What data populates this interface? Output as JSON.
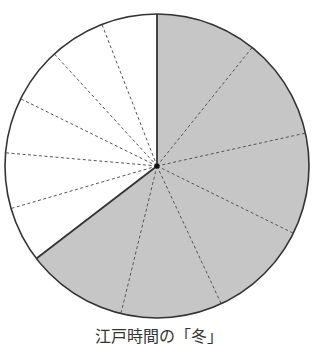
{
  "caption": "江戸時間の「冬」",
  "colors": {
    "night_fill": "#c6c6c6",
    "day_fill": "#ffffff",
    "outline": "#333333",
    "divider": "#555555"
  },
  "geometry": {
    "cx": 157,
    "cy": 166,
    "r": 152
  },
  "chart_data": {
    "type": "pie",
    "title": "江戸時間の「冬」",
    "start_angle_deg": 0,
    "direction": "clockwise",
    "series": [
      {
        "name": "night (gray)",
        "fill": "#c6c6c6",
        "span_deg": 232.5,
        "divisions": 6,
        "segment_deg": [
          38.75,
          38.75,
          38.75,
          38.75,
          38.75,
          38.75
        ]
      },
      {
        "name": "day (white)",
        "fill": "#ffffff",
        "span_deg": 127.5,
        "divisions": 6,
        "segment_deg": [
          21.25,
          21.25,
          21.25,
          21.25,
          21.25,
          21.25
        ]
      }
    ],
    "boundary_angles_deg": [
      0,
      38.75,
      77.5,
      116.25,
      155,
      193.75,
      232.5,
      253.75,
      275,
      296.25,
      317.5,
      338.75
    ],
    "solid_boundaries_deg": [
      0,
      232.5
    ],
    "dashed_boundaries_deg": [
      38.75,
      77.5,
      116.25,
      155,
      193.75,
      253.75,
      275,
      296.25,
      317.5,
      338.75
    ],
    "legend": [],
    "xlabel": "",
    "ylabel": ""
  }
}
